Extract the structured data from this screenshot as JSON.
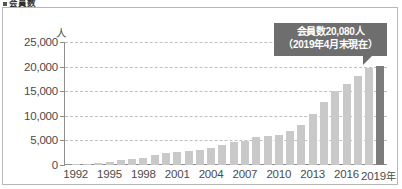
{
  "heading": {
    "text": "会員数",
    "bullet_icon": "square-bullet-icon"
  },
  "chart_data": {
    "type": "bar",
    "title": "会員数",
    "xlabel": "",
    "ylabel": "人",
    "unit_label": "人",
    "ylim": [
      0,
      25000
    ],
    "ytick_values": [
      0,
      5000,
      10000,
      15000,
      20000,
      25000
    ],
    "ytick_labels": [
      "0",
      "5,000",
      "10,000",
      "15,000",
      "20,000",
      "25,000"
    ],
    "grid": true,
    "legend": null,
    "x_axis_suffix": "年",
    "categories": [
      "1992",
      "1993",
      "1994",
      "1995",
      "1996",
      "1997",
      "1998",
      "1999",
      "2000",
      "2001",
      "2002",
      "2003",
      "2004",
      "2005",
      "2006",
      "2007",
      "2008",
      "2009",
      "2010",
      "2011",
      "2012",
      "2013",
      "2014",
      "2015",
      "2016",
      "2017",
      "2018",
      "2019"
    ],
    "xtick_labels": [
      "1992",
      "1995",
      "1998",
      "2001",
      "2004",
      "2007",
      "2010",
      "2013",
      "2016",
      "2019"
    ],
    "values": [
      60,
      180,
      430,
      700,
      960,
      1180,
      1400,
      1950,
      2350,
      2550,
      2800,
      3150,
      3450,
      4150,
      4600,
      4950,
      5700,
      5900,
      6200,
      6900,
      8100,
      10400,
      12900,
      15000,
      16400,
      18000,
      19800,
      20080
    ],
    "highlight_index": 27,
    "highlight_color": "#7c7c7c",
    "bar_color": "#c9c9c9",
    "annotations": [
      {
        "line1": "会員数20,080人",
        "line2": "（2019年4月末現在）",
        "target_category": "2019",
        "target_value": 20080
      }
    ]
  }
}
